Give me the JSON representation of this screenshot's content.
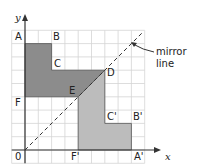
{
  "diagram": {
    "type": "reflection",
    "axes": {
      "x_label": "x",
      "y_label": "y",
      "origin_label": "0"
    },
    "grid": {
      "x_min": -1,
      "x_max": 9,
      "y_min": -1,
      "y_max": 9
    },
    "mirror_line": {
      "label_line1": "mirror",
      "label_line2": "line",
      "equation": "y = x"
    },
    "original_shape": {
      "color": "#8c8c8c",
      "vertices": [
        {
          "label": "A",
          "x": 0,
          "y": 8
        },
        {
          "label": "B",
          "x": 2,
          "y": 8
        },
        {
          "label": "C",
          "x": 2,
          "y": 6
        },
        {
          "label": "D",
          "x": 6,
          "y": 6
        },
        {
          "label": "E",
          "x": 4,
          "y": 4
        },
        {
          "label": "F",
          "x": 0,
          "y": 4
        }
      ]
    },
    "image_shape": {
      "color": "#bcbcbc",
      "vertices": [
        {
          "label": "A'",
          "x": 8,
          "y": 0
        },
        {
          "label": "B'",
          "x": 8,
          "y": 2
        },
        {
          "label": "C'",
          "x": 6,
          "y": 2
        },
        {
          "label": "D",
          "x": 6,
          "y": 6
        },
        {
          "label": "E",
          "x": 4,
          "y": 4
        },
        {
          "label": "F'",
          "x": 4,
          "y": 0
        }
      ]
    }
  }
}
